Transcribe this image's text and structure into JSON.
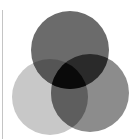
{
  "diagram": {
    "type": "venn-3",
    "circles": [
      {
        "name": "top",
        "cx": 70,
        "cy": 50,
        "r": 39,
        "color": "#6b6b6b"
      },
      {
        "name": "bottom-left",
        "cx": 50,
        "cy": 97,
        "r": 38,
        "color": "#c8c8c8"
      },
      {
        "name": "bottom-right",
        "cx": 90,
        "cy": 93,
        "r": 39,
        "color": "#8c8c8c"
      }
    ],
    "overlaps": {
      "top_left": "#555555",
      "top_right": "#2a2a2a",
      "left_right": "#5e5e5e",
      "all_three": "#0a0a0a"
    },
    "edge_line_color": "#c4c4c4"
  }
}
